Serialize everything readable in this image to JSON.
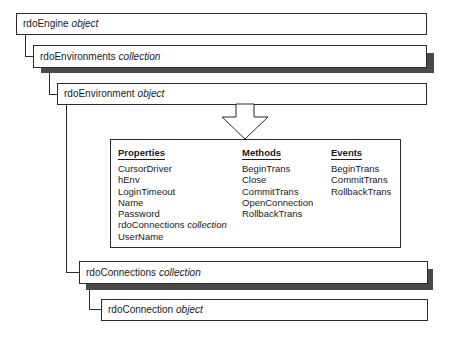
{
  "nodes": [
    {
      "id": "rdoEngine",
      "name": "rdoEngine",
      "kind": "object"
    },
    {
      "id": "rdoEnvironments",
      "name": "rdoEnvironments",
      "kind": "collection"
    },
    {
      "id": "rdoEnvironment",
      "name": "rdoEnvironment",
      "kind": "object"
    },
    {
      "id": "rdoConnections",
      "name": "rdoConnections",
      "kind": "collection"
    },
    {
      "id": "rdoConnection",
      "name": "rdoConnection",
      "kind": "object"
    }
  ],
  "detail_panel": {
    "properties": {
      "header": "Properties",
      "items": [
        {
          "name": "CursorDriver",
          "kind": ""
        },
        {
          "name": "hEnv",
          "kind": ""
        },
        {
          "name": "LoginTimeout",
          "kind": ""
        },
        {
          "name": "Name",
          "kind": ""
        },
        {
          "name": "Password",
          "kind": ""
        },
        {
          "name": "rdoConnections",
          "kind": "collection"
        },
        {
          "name": "UserName",
          "kind": ""
        }
      ]
    },
    "methods": {
      "header": "Methods",
      "items": [
        "BeginTrans",
        "Close",
        "CommitTrans",
        "OpenConnection",
        "RollbackTrans"
      ]
    },
    "events": {
      "header": "Events",
      "items": [
        "BeginTrans",
        "CommitTrans",
        "RollbackTrans"
      ]
    }
  },
  "colors": {
    "border": "#2a2a2a",
    "shadow": "#4a4a4a",
    "background": "#ffffff"
  }
}
